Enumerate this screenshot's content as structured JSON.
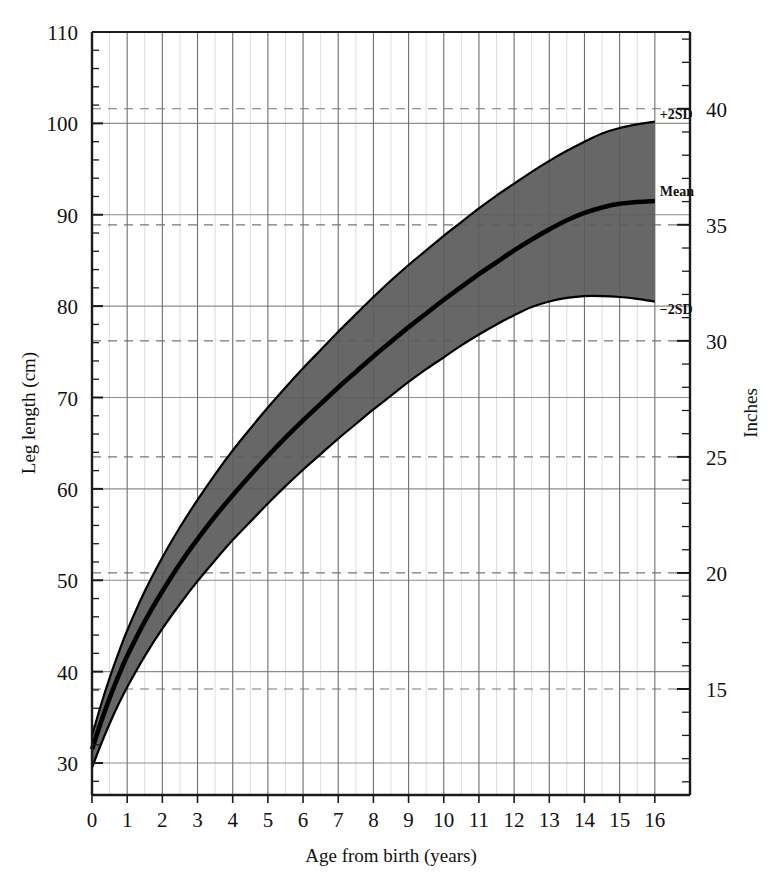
{
  "chart_data": {
    "type": "area",
    "title": "",
    "xlabel": "Age from birth (years)",
    "ylabel": "Leg length (cm)",
    "y2label": "Inches",
    "xlim": [
      0,
      17
    ],
    "ylim": [
      26.5,
      110
    ],
    "y2lim": [
      10.4,
      43.3
    ],
    "grid": true,
    "legend_position": "inline-right",
    "x_ticks": [
      0,
      1,
      2,
      3,
      4,
      5,
      6,
      7,
      8,
      9,
      10,
      11,
      12,
      13,
      14,
      15,
      16
    ],
    "x_tick_labels": [
      "0",
      "1",
      "2",
      "3",
      "4",
      "5",
      "6",
      "7",
      "8",
      "9",
      "10",
      "11",
      "12",
      "13",
      "14",
      "15",
      "16"
    ],
    "y_ticks": [
      30,
      40,
      50,
      60,
      70,
      80,
      90,
      100,
      110
    ],
    "y_tick_labels": [
      "30",
      "40",
      "50",
      "60",
      "70",
      "80",
      "90",
      "100",
      "110"
    ],
    "y_minor_step": 2,
    "y2_ticks": [
      15,
      20,
      25,
      30,
      35,
      40
    ],
    "y2_tick_labels": [
      "15",
      "20",
      "25",
      "30",
      "35",
      "40"
    ],
    "y2_minor_step": 1,
    "x": [
      0,
      0.25,
      0.5,
      0.75,
      1,
      1.5,
      2,
      2.5,
      3,
      3.5,
      4,
      4.5,
      5,
      5.5,
      6,
      6.5,
      7,
      7.5,
      8,
      8.5,
      9,
      9.5,
      10,
      10.5,
      11,
      11.5,
      12,
      12.5,
      13,
      13.5,
      14,
      14.5,
      15,
      15.5,
      16
    ],
    "series": [
      {
        "name": "+2SD",
        "label": "+2SD",
        "color": "#000000",
        "values": [
          33.0,
          36.3,
          39.3,
          42.0,
          44.5,
          48.8,
          52.5,
          55.8,
          58.8,
          61.6,
          64.2,
          66.6,
          68.9,
          71.1,
          73.2,
          75.2,
          77.2,
          79.1,
          81.0,
          82.8,
          84.5,
          86.1,
          87.7,
          89.2,
          90.7,
          92.1,
          93.4,
          94.7,
          95.9,
          97.0,
          98.0,
          98.9,
          99.5,
          99.9,
          100.2
        ]
      },
      {
        "name": "Mean",
        "label": "Mean",
        "color": "#000000",
        "values": [
          31.5,
          34.4,
          37.1,
          39.5,
          41.7,
          45.5,
          48.8,
          51.8,
          54.5,
          57.0,
          59.3,
          61.5,
          63.6,
          65.6,
          67.5,
          69.3,
          71.1,
          72.8,
          74.5,
          76.1,
          77.7,
          79.2,
          80.7,
          82.1,
          83.5,
          84.8,
          86.1,
          87.3,
          88.4,
          89.4,
          90.2,
          90.8,
          91.2,
          91.4,
          91.5
        ]
      },
      {
        "name": "-2SD",
        "label": "−2SD",
        "color": "#000000",
        "values": [
          29.5,
          32.0,
          34.3,
          36.4,
          38.3,
          41.7,
          44.7,
          47.4,
          49.9,
          52.2,
          54.4,
          56.4,
          58.4,
          60.3,
          62.1,
          63.8,
          65.5,
          67.1,
          68.7,
          70.2,
          71.7,
          73.1,
          74.4,
          75.7,
          76.9,
          78.0,
          79.0,
          79.9,
          80.5,
          80.9,
          81.1,
          81.1,
          81.0,
          80.8,
          80.5
        ]
      }
    ],
    "band_fill_color": "#5a5a5a",
    "band_description": "Shaded region between -2SD and +2SD percentile curves",
    "annotations": [
      {
        "text": "+2SD",
        "anchor_series": "+2SD",
        "x": 16
      },
      {
        "text": "Mean",
        "anchor_series": "Mean",
        "x": 16
      },
      {
        "text": "−2SD",
        "anchor_series": "-2SD",
        "x": 16
      }
    ]
  },
  "axes": {
    "left_title": "Leg length (cm)",
    "right_title": "Inches",
    "bottom_title": "Age from birth (years)"
  }
}
